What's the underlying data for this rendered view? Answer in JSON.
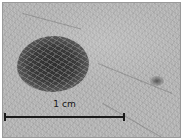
{
  "image": {
    "description": "Grayscale close-up photograph of a dark pigmented skin lesion with a scale bar",
    "background_color": "#b5b5b5",
    "lesion_color": "#2e2e2e"
  },
  "scale_bar": {
    "label": "1 cm",
    "color": "#1a1a1a"
  }
}
